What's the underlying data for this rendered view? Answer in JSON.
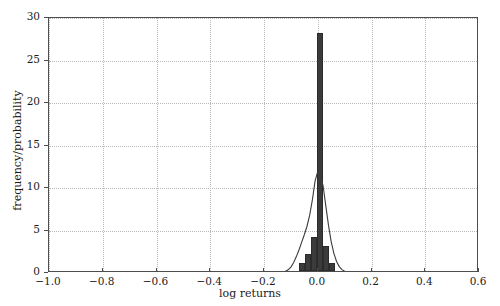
{
  "chart_data": {
    "type": "bar",
    "title": "",
    "xlabel": "log returns",
    "ylabel": "frequency/probability",
    "xlim": [
      -1.0,
      0.6
    ],
    "ylim": [
      0,
      30
    ],
    "xticks": [
      -1.0,
      -0.8,
      -0.6,
      -0.4,
      -0.2,
      0.0,
      0.2,
      0.4,
      0.6
    ],
    "xtick_labels": [
      "−1.0",
      "−0.8",
      "−0.6",
      "−0.4",
      "−0.2",
      "0.0",
      "0.2",
      "0.4",
      "0.6"
    ],
    "yticks": [
      0,
      5,
      10,
      15,
      20,
      25,
      30
    ],
    "ytick_labels": [
      "0",
      "5",
      "10",
      "15",
      "20",
      "25",
      "30"
    ],
    "grid": true,
    "legend": "none",
    "bar_color": "#3b3b3b",
    "line_color": "#3b3b3b",
    "bin_edges": [
      -0.07,
      -0.0475,
      -0.025,
      -0.0025,
      0.02,
      0.0425,
      0.065
    ],
    "bin_centers": [
      -0.0588,
      -0.0363,
      -0.0138,
      0.0088,
      0.0313,
      0.0538
    ],
    "values": [
      1,
      2,
      4,
      28,
      3,
      1
    ],
    "categories": [
      "-0.059",
      "-0.036",
      "-0.014",
      "0.009",
      "0.031",
      "0.054"
    ],
    "series": [
      {
        "name": "histogram",
        "type": "bar",
        "values": [
          1,
          2,
          4,
          28,
          3,
          1
        ]
      },
      {
        "name": "kde",
        "type": "line",
        "x": [
          -0.14,
          -0.13,
          -0.12,
          -0.11,
          -0.1,
          -0.09,
          -0.08,
          -0.07,
          -0.06,
          -0.05,
          -0.04,
          -0.03,
          -0.02,
          -0.01,
          0.0,
          0.005,
          0.01,
          0.02,
          0.03,
          0.04,
          0.05,
          0.06,
          0.07,
          0.08,
          0.09,
          0.1,
          0.11,
          0.12
        ],
        "y": [
          0.05,
          0.1,
          0.2,
          0.38,
          0.7,
          1.2,
          1.9,
          2.7,
          3.6,
          4.5,
          5.5,
          6.8,
          8.6,
          10.8,
          11.95,
          12.0,
          11.7,
          10.2,
          7.9,
          5.6,
          3.7,
          2.3,
          1.35,
          0.75,
          0.4,
          0.2,
          0.09,
          0.04
        ]
      }
    ]
  },
  "axes": {
    "x_title": "log returns",
    "y_title": "frequency/probability"
  }
}
